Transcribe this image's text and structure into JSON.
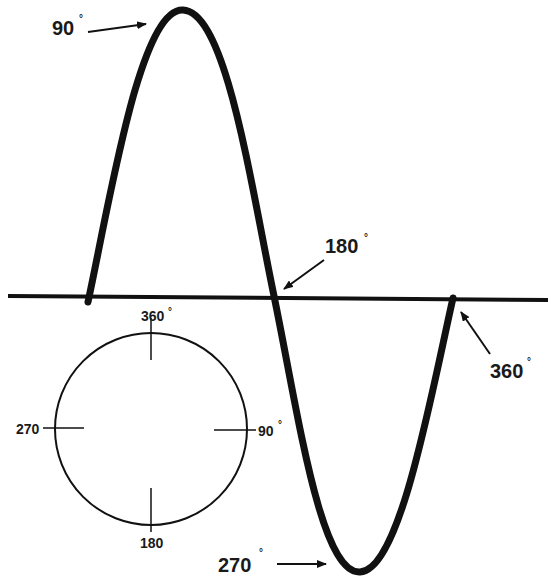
{
  "diagram": {
    "colors": {
      "stroke": "#111111",
      "background": "#ffffff"
    },
    "wave_labels": {
      "peak": {
        "text": "90",
        "degree": "°"
      },
      "zero_cross": {
        "text": "180",
        "degree": "°"
      },
      "trough": {
        "text": "270",
        "degree": "°"
      },
      "end": {
        "text": "360",
        "degree": "°"
      }
    },
    "circle_labels": {
      "top": {
        "text": "360",
        "degree": "°"
      },
      "right": {
        "text": "90",
        "degree": "°"
      },
      "bottom": {
        "text": "180"
      },
      "left": {
        "text": "270"
      }
    }
  }
}
